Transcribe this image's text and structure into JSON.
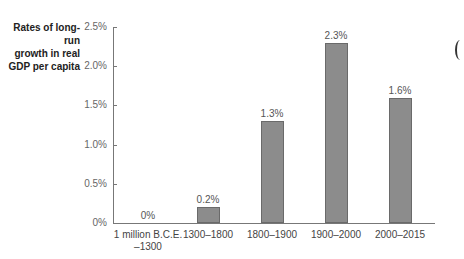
{
  "chart_data": {
    "type": "bar",
    "title": "",
    "ylabel": "Rates of long-run growth in real GDP per capita",
    "ylabel_lines": [
      "Rates of long-run",
      "growth in real",
      "GDP per capita"
    ],
    "xlabel": "",
    "categories": [
      "1 million B.C.E. –1300",
      "1300–1800",
      "1800–1900",
      "1900–2000",
      "2000–2015"
    ],
    "category_lines": [
      [
        "1 million B.C.E.",
        "–1300"
      ],
      [
        "1300–1800"
      ],
      [
        "1800–1900"
      ],
      [
        "1900–2000"
      ],
      [
        "2000–2015"
      ]
    ],
    "values": [
      0,
      0.2,
      1.3,
      2.3,
      1.6
    ],
    "value_labels": [
      "0%",
      "0.2%",
      "1.3%",
      "2.3%",
      "1.6%"
    ],
    "ylim": [
      0,
      2.5
    ],
    "yticks": [
      0,
      0.5,
      1.0,
      1.5,
      2.0,
      2.5
    ],
    "ytick_labels": [
      "0%",
      "0.5%",
      "1.0%",
      "1.5%",
      "2.0%",
      "2.5%"
    ],
    "grid": false,
    "legend": null,
    "bar_color": "#8c8c8c"
  }
}
